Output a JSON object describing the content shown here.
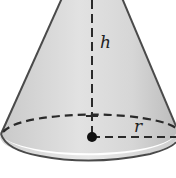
{
  "figure": {
    "shape": "right-circular-cone",
    "labels": {
      "height": "h",
      "radius": "r"
    },
    "colors": {
      "fill_light": "#e4e4e4",
      "fill_dark": "#bdbdbd",
      "outline": "#4a4a4a",
      "dash": "#2a2a2a",
      "background": "#ffffff"
    }
  }
}
